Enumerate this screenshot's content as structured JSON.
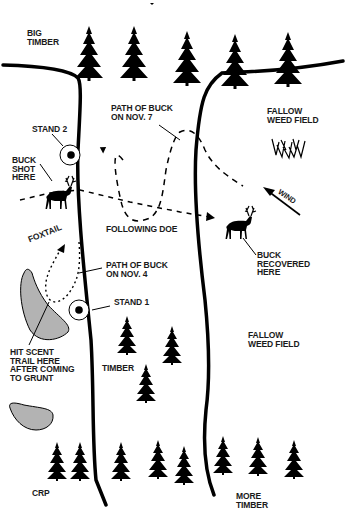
{
  "map": {
    "type": "hunting-stand diagram",
    "colors": {
      "ink": "#000000",
      "text": "#1a1a1a",
      "bedding_fill": "#b3b3b3",
      "background": "#ffffff"
    },
    "labels": {
      "big_timber": "BIG\nTIMBER",
      "fallow_top": "FALLOW\nWEED FIELD",
      "fallow_bottom": "FALLOW\nWEED FIELD",
      "path_nov7": "PATH OF BUCK\nON NOV. 7",
      "stand2": "STAND 2",
      "buck_shot": "BUCK\nSHOT\nHERE",
      "wind": "WIND",
      "foxtail": "FOXTAIL",
      "following_doe": "FOLLOWING DOE",
      "buck_recovered": "BUCK\nRECOVERED\nHERE",
      "path_nov4": "PATH OF BUCK\nON NOV. 4",
      "stand1": "STAND 1",
      "hit_scent": "HIT SCENT\nTRAIL HERE\nAFTER COMING\nTO GRUNT",
      "timber": "TIMBER",
      "crp": "CRP",
      "more_timber": "MORE\nTIMBER"
    },
    "stands": [
      {
        "name": "Stand 2",
        "x": 70,
        "y": 155
      },
      {
        "name": "Stand 1",
        "x": 79,
        "y": 310
      }
    ],
    "deer": [
      {
        "name": "buck-shot",
        "x": 62,
        "y": 207
      },
      {
        "name": "buck-recovered",
        "x": 238,
        "y": 237
      }
    ]
  }
}
